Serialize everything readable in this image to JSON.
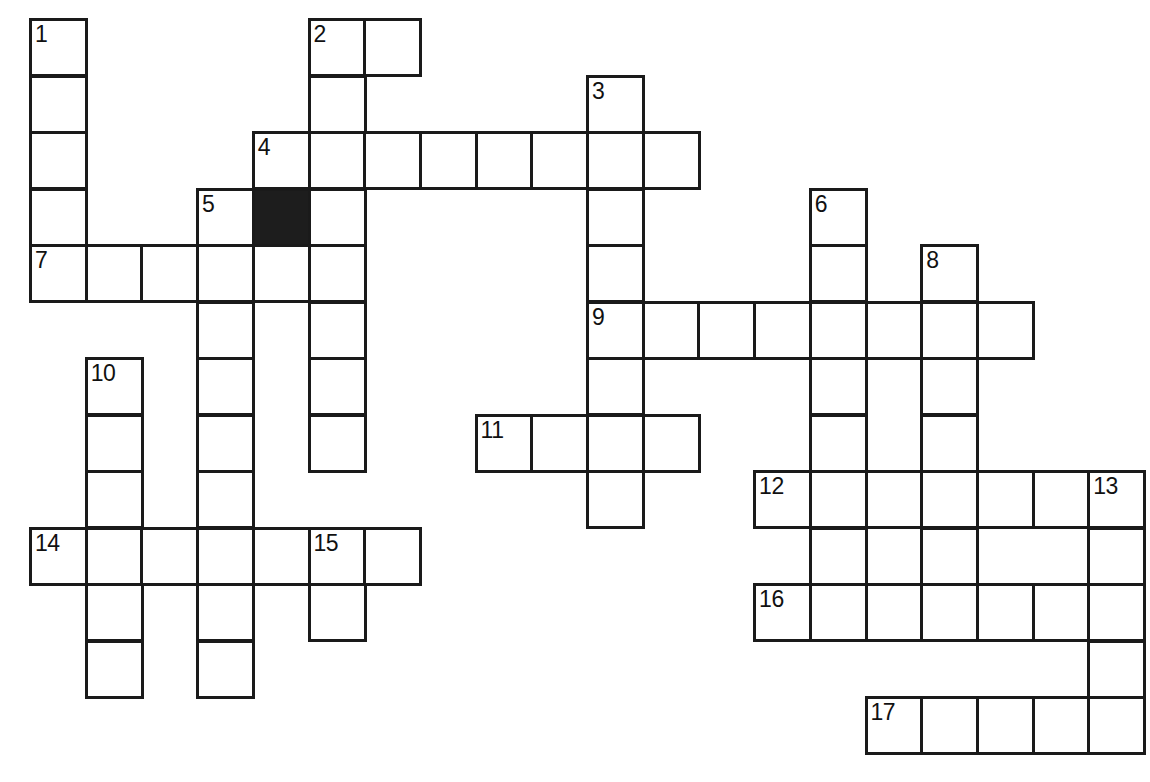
{
  "puzzle": {
    "title": "Crossword Puzzle Grid",
    "grid": {
      "columns": 21,
      "rows": 13,
      "cell_size": 56,
      "origin_x": 29,
      "origin_y": 18,
      "col_step": 55.7,
      "row_step": 56.5,
      "line_color": "#1a1a1a",
      "cell_color": "#ffffff",
      "block_color": "#1d1d1d",
      "number_color": "#111111"
    },
    "numbers": [
      "1",
      "2",
      "3",
      "4",
      "5",
      "6",
      "7",
      "8",
      "9",
      "10",
      "11",
      "12",
      "13",
      "14",
      "15",
      "16",
      "17"
    ],
    "entries": [
      {
        "number": "1",
        "direction": "down",
        "col": 0,
        "row": 0,
        "length": 5
      },
      {
        "number": "2",
        "direction": "across",
        "col": 5,
        "row": 0,
        "length": 2
      },
      {
        "number": "2",
        "direction": "down",
        "col": 5,
        "row": 0,
        "length": 4
      },
      {
        "number": "3",
        "direction": "down",
        "col": 10,
        "row": 1,
        "length": 8
      },
      {
        "number": "4",
        "direction": "across",
        "col": 4,
        "row": 2,
        "length": 8
      },
      {
        "number": "5",
        "direction": "down",
        "col": 3,
        "row": 3,
        "length": 9
      },
      {
        "number": "6",
        "direction": "down",
        "col": 14,
        "row": 3,
        "length": 7
      },
      {
        "number": "7",
        "direction": "across",
        "col": 0,
        "row": 4,
        "length": 6
      },
      {
        "number": "8",
        "direction": "down",
        "col": 16,
        "row": 4,
        "length": 7
      },
      {
        "number": "9",
        "direction": "across",
        "col": 10,
        "row": 5,
        "length": 8
      },
      {
        "number": "10",
        "direction": "down",
        "col": 1,
        "row": 6,
        "length": 6
      },
      {
        "number": "11",
        "direction": "across",
        "col": 8,
        "row": 7,
        "length": 4
      },
      {
        "number": "12",
        "direction": "across",
        "col": 13,
        "row": 8,
        "length": 7
      },
      {
        "number": "13",
        "direction": "down",
        "col": 19,
        "row": 8,
        "length": 5
      },
      {
        "number": "14",
        "direction": "across",
        "col": 0,
        "row": 9,
        "length": 7
      },
      {
        "number": "15",
        "direction": "down",
        "col": 5,
        "row": 9,
        "length": 2
      },
      {
        "number": "16",
        "direction": "across",
        "col": 13,
        "row": 10,
        "length": 7
      },
      {
        "number": "17",
        "direction": "across",
        "col": 15,
        "row": 12,
        "length": 5
      }
    ],
    "cells": [
      {
        "col": 0,
        "row": 0,
        "number": "1",
        "value": ""
      },
      {
        "col": 5,
        "row": 0,
        "number": "2",
        "value": ""
      },
      {
        "col": 6,
        "row": 0,
        "number": "",
        "value": ""
      },
      {
        "col": 0,
        "row": 1,
        "number": "",
        "value": ""
      },
      {
        "col": 5,
        "row": 1,
        "number": "",
        "value": ""
      },
      {
        "col": 10,
        "row": 1,
        "number": "3",
        "value": ""
      },
      {
        "col": 0,
        "row": 2,
        "number": "",
        "value": ""
      },
      {
        "col": 4,
        "row": 2,
        "number": "4",
        "value": ""
      },
      {
        "col": 5,
        "row": 2,
        "number": "",
        "value": ""
      },
      {
        "col": 6,
        "row": 2,
        "number": "",
        "value": ""
      },
      {
        "col": 7,
        "row": 2,
        "number": "",
        "value": ""
      },
      {
        "col": 8,
        "row": 2,
        "number": "",
        "value": ""
      },
      {
        "col": 9,
        "row": 2,
        "number": "",
        "value": ""
      },
      {
        "col": 10,
        "row": 2,
        "number": "",
        "value": ""
      },
      {
        "col": 11,
        "row": 2,
        "number": "",
        "value": ""
      },
      {
        "col": 0,
        "row": 3,
        "number": "",
        "value": ""
      },
      {
        "col": 3,
        "row": 3,
        "number": "5",
        "value": ""
      },
      {
        "col": 4,
        "row": 3,
        "number": "",
        "value": "",
        "block": true
      },
      {
        "col": 5,
        "row": 3,
        "number": "",
        "value": ""
      },
      {
        "col": 10,
        "row": 3,
        "number": "",
        "value": ""
      },
      {
        "col": 14,
        "row": 3,
        "number": "6",
        "value": ""
      },
      {
        "col": 0,
        "row": 4,
        "number": "7",
        "value": ""
      },
      {
        "col": 1,
        "row": 4,
        "number": "",
        "value": ""
      },
      {
        "col": 2,
        "row": 4,
        "number": "",
        "value": ""
      },
      {
        "col": 3,
        "row": 4,
        "number": "",
        "value": ""
      },
      {
        "col": 4,
        "row": 4,
        "number": "",
        "value": ""
      },
      {
        "col": 5,
        "row": 4,
        "number": "",
        "value": ""
      },
      {
        "col": 10,
        "row": 4,
        "number": "",
        "value": ""
      },
      {
        "col": 14,
        "row": 4,
        "number": "",
        "value": ""
      },
      {
        "col": 16,
        "row": 4,
        "number": "8",
        "value": ""
      },
      {
        "col": 3,
        "row": 5,
        "number": "",
        "value": ""
      },
      {
        "col": 5,
        "row": 5,
        "number": "",
        "value": ""
      },
      {
        "col": 10,
        "row": 5,
        "number": "9",
        "value": ""
      },
      {
        "col": 11,
        "row": 5,
        "number": "",
        "value": ""
      },
      {
        "col": 12,
        "row": 5,
        "number": "",
        "value": ""
      },
      {
        "col": 13,
        "row": 5,
        "number": "",
        "value": ""
      },
      {
        "col": 14,
        "row": 5,
        "number": "",
        "value": ""
      },
      {
        "col": 15,
        "row": 5,
        "number": "",
        "value": ""
      },
      {
        "col": 16,
        "row": 5,
        "number": "",
        "value": ""
      },
      {
        "col": 17,
        "row": 5,
        "number": "",
        "value": ""
      },
      {
        "col": 1,
        "row": 6,
        "number": "10",
        "value": ""
      },
      {
        "col": 3,
        "row": 6,
        "number": "",
        "value": ""
      },
      {
        "col": 5,
        "row": 6,
        "number": "",
        "value": ""
      },
      {
        "col": 10,
        "row": 6,
        "number": "",
        "value": ""
      },
      {
        "col": 14,
        "row": 6,
        "number": "",
        "value": ""
      },
      {
        "col": 16,
        "row": 6,
        "number": "",
        "value": ""
      },
      {
        "col": 1,
        "row": 7,
        "number": "",
        "value": ""
      },
      {
        "col": 3,
        "row": 7,
        "number": "",
        "value": ""
      },
      {
        "col": 5,
        "row": 7,
        "number": "",
        "value": ""
      },
      {
        "col": 8,
        "row": 7,
        "number": "11",
        "value": ""
      },
      {
        "col": 9,
        "row": 7,
        "number": "",
        "value": ""
      },
      {
        "col": 10,
        "row": 7,
        "number": "",
        "value": ""
      },
      {
        "col": 11,
        "row": 7,
        "number": "",
        "value": ""
      },
      {
        "col": 14,
        "row": 7,
        "number": "",
        "value": ""
      },
      {
        "col": 16,
        "row": 7,
        "number": "",
        "value": ""
      },
      {
        "col": 1,
        "row": 8,
        "number": "",
        "value": ""
      },
      {
        "col": 3,
        "row": 8,
        "number": "",
        "value": ""
      },
      {
        "col": 10,
        "row": 8,
        "number": "",
        "value": ""
      },
      {
        "col": 13,
        "row": 8,
        "number": "12",
        "value": ""
      },
      {
        "col": 14,
        "row": 8,
        "number": "",
        "value": ""
      },
      {
        "col": 15,
        "row": 8,
        "number": "",
        "value": ""
      },
      {
        "col": 16,
        "row": 8,
        "number": "",
        "value": ""
      },
      {
        "col": 17,
        "row": 8,
        "number": "",
        "value": ""
      },
      {
        "col": 18,
        "row": 8,
        "number": "",
        "value": ""
      },
      {
        "col": 19,
        "row": 8,
        "number": "13",
        "value": ""
      },
      {
        "col": 0,
        "row": 9,
        "number": "14",
        "value": ""
      },
      {
        "col": 1,
        "row": 9,
        "number": "",
        "value": ""
      },
      {
        "col": 2,
        "row": 9,
        "number": "",
        "value": ""
      },
      {
        "col": 3,
        "row": 9,
        "number": "",
        "value": ""
      },
      {
        "col": 4,
        "row": 9,
        "number": "",
        "value": ""
      },
      {
        "col": 5,
        "row": 9,
        "number": "15",
        "value": ""
      },
      {
        "col": 6,
        "row": 9,
        "number": "",
        "value": ""
      },
      {
        "col": 14,
        "row": 9,
        "number": "",
        "value": ""
      },
      {
        "col": 16,
        "row": 9,
        "number": "",
        "value": ""
      },
      {
        "col": 19,
        "row": 9,
        "number": "",
        "value": ""
      },
      {
        "col": 1,
        "row": 10,
        "number": "",
        "value": ""
      },
      {
        "col": 3,
        "row": 10,
        "number": "",
        "value": ""
      },
      {
        "col": 5,
        "row": 10,
        "number": "",
        "value": ""
      },
      {
        "col": 13,
        "row": 10,
        "number": "16",
        "value": ""
      },
      {
        "col": 14,
        "row": 10,
        "number": "",
        "value": ""
      },
      {
        "col": 15,
        "row": 10,
        "number": "",
        "value": ""
      },
      {
        "col": 16,
        "row": 10,
        "number": "",
        "value": ""
      },
      {
        "col": 17,
        "row": 10,
        "number": "",
        "value": ""
      },
      {
        "col": 18,
        "row": 10,
        "number": "",
        "value": ""
      },
      {
        "col": 19,
        "row": 10,
        "number": "",
        "value": ""
      },
      {
        "col": 1,
        "row": 11,
        "number": "",
        "value": ""
      },
      {
        "col": 3,
        "row": 11,
        "number": "",
        "value": ""
      },
      {
        "col": 19,
        "row": 11,
        "number": "",
        "value": ""
      },
      {
        "col": 15,
        "row": 12,
        "number": "17",
        "value": ""
      },
      {
        "col": 16,
        "row": 12,
        "number": "",
        "value": ""
      },
      {
        "col": 17,
        "row": 12,
        "number": "",
        "value": ""
      },
      {
        "col": 18,
        "row": 12,
        "number": "",
        "value": ""
      },
      {
        "col": 19,
        "row": 12,
        "number": "",
        "value": ""
      }
    ]
  }
}
